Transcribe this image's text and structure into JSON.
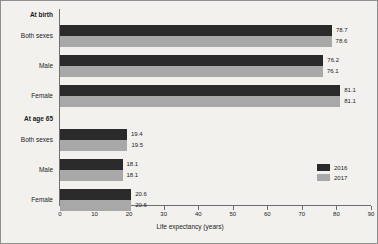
{
  "chart_data": {
    "type": "bar",
    "orientation": "horizontal",
    "title": "",
    "xlabel": "Life expectancy (years)",
    "ylabel": "",
    "xlim": [
      0,
      90
    ],
    "xticks": [
      0,
      10,
      20,
      30,
      40,
      50,
      60,
      70,
      80,
      90
    ],
    "grid": false,
    "legend_position": "right",
    "series": [
      {
        "name": "2016",
        "color": "#2a2a2a"
      },
      {
        "name": "2017",
        "color": "#a8a8a8"
      }
    ],
    "groups": [
      {
        "label": "At birth",
        "categories": [
          {
            "label": "Both sexes",
            "values": [
              78.7,
              78.6
            ]
          },
          {
            "label": "Male",
            "values": [
              76.2,
              76.1
            ]
          },
          {
            "label": "Female",
            "values": [
              81.1,
              81.1
            ]
          }
        ]
      },
      {
        "label": "At age 65",
        "categories": [
          {
            "label": "Both sexes",
            "values": [
              19.4,
              19.5
            ]
          },
          {
            "label": "Male",
            "values": [
              18.1,
              18.1
            ]
          },
          {
            "label": "Female",
            "values": [
              20.6,
              20.6
            ]
          }
        ]
      }
    ]
  },
  "axis": {
    "tick_labels": [
      "0",
      "10",
      "20",
      "30",
      "40",
      "50",
      "60",
      "70",
      "80",
      "90"
    ],
    "title": "Life expectancy (years)"
  },
  "legend": {
    "items": [
      {
        "label": "2016"
      },
      {
        "label": "2017"
      }
    ]
  }
}
